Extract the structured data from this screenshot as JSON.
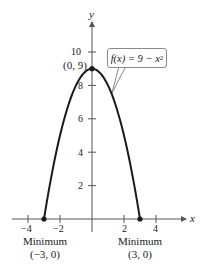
{
  "chart_data": {
    "type": "line",
    "title": "",
    "function_label": "f(x) = 9 − x²",
    "function_parts": {
      "prefix": "f(x) = 9 − x",
      "exponent": "2"
    },
    "xlabel": "x",
    "ylabel": "y",
    "xlim": [
      -4.5,
      4.5
    ],
    "ylim": [
      0,
      11
    ],
    "grid": false,
    "legend": "none",
    "x_ticks": [
      -4,
      -2,
      2,
      4
    ],
    "x_tick_labels": [
      "−4",
      "−2",
      "2",
      "4"
    ],
    "y_ticks": [
      2,
      4,
      6,
      8,
      10
    ],
    "y_tick_labels": [
      "2",
      "4",
      "6",
      "8",
      "10"
    ],
    "series": [
      {
        "name": "f(x) = 9 − x²",
        "domain": [
          -3,
          3
        ],
        "x": [
          -3,
          -2.5,
          -2,
          -1.5,
          -1,
          -0.5,
          0,
          0.5,
          1,
          1.5,
          2,
          2.5,
          3
        ],
        "y": [
          0,
          2.75,
          5,
          6.75,
          8,
          8.75,
          9,
          8.75,
          8,
          6.75,
          5,
          2.75,
          0
        ]
      }
    ],
    "points": [
      {
        "x": 0,
        "y": 9,
        "label": "(0, 9)"
      },
      {
        "x": -3,
        "y": 0,
        "label": "(−3, 0)",
        "caption": "Minimum"
      },
      {
        "x": 3,
        "y": 0,
        "label": "(3, 0)",
        "caption": "Minimum"
      }
    ],
    "annotations": {
      "vertex_label": "(0, 9)",
      "left_min_caption": "Minimum",
      "left_min_label": "(−3, 0)",
      "right_min_caption": "Minimum",
      "right_min_label": "(3, 0)"
    },
    "colors": {
      "curve": "#1a1a1a",
      "axis": "#555555",
      "callout_border": "#8a8a8a"
    }
  }
}
